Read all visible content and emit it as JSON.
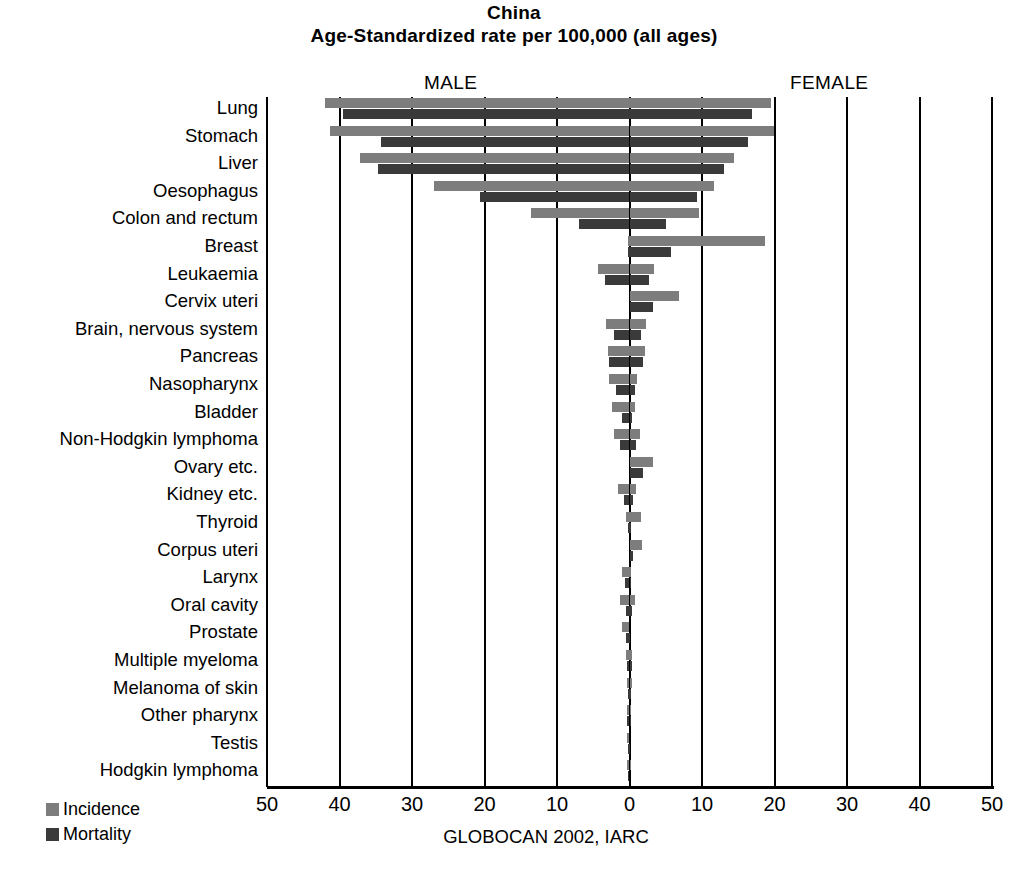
{
  "title": {
    "line1": "China",
    "line2": "Age-Standardized rate per 100,000 (all ages)"
  },
  "male_label": "MALE",
  "female_label": "FEMALE",
  "source": "GLOBOCAN 2002, IARC",
  "legend": [
    {
      "name": "Incidence",
      "color": "#7d7d7d"
    },
    {
      "name": "Mortality",
      "color": "#3a3a3a"
    }
  ],
  "colors": {
    "incidence": "#7d7d7d",
    "mortality": "#3a3a3a",
    "axis": "#000000",
    "background": "#ffffff"
  },
  "chart_data": {
    "type": "bar",
    "orientation": "horizontal",
    "subtype": "population-pyramid / back-to-back bar",
    "xlabel": "",
    "ylabel": "",
    "xlim": [
      -50,
      50
    ],
    "xticks": [
      50,
      40,
      30,
      20,
      10,
      0,
      10,
      20,
      30,
      40,
      50
    ],
    "xtick_labels": [
      "50",
      "40",
      "30",
      "20",
      "10",
      "0",
      "10",
      "20",
      "30",
      "40",
      "50"
    ],
    "left_panel": "MALE",
    "right_panel": "FEMALE",
    "grid": true,
    "legend_position": "bottom-left",
    "units": "rate per 100,000",
    "source": "GLOBOCAN 2002, IARC",
    "categories": [
      "Lung",
      "Stomach",
      "Liver",
      "Oesophagus",
      "Colon and rectum",
      "Breast",
      "Leukaemia",
      "Cervix uteri",
      "Brain, nervous system",
      "Pancreas",
      "Nasopharynx",
      "Bladder",
      "Non-Hodgkin lymphoma",
      "Ovary etc.",
      "Kidney etc.",
      "Thyroid",
      "Corpus uteri",
      "Larynx",
      "Oral cavity",
      "Prostate",
      "Multiple myeloma",
      "Melanoma of skin",
      "Other pharynx",
      "Testis",
      "Hodgkin lymphoma"
    ],
    "series": [
      {
        "name": "Male incidence",
        "side": "left",
        "color": "#7d7d7d",
        "values": [
          42.0,
          41.3,
          37.2,
          27.0,
          13.6,
          0.2,
          4.3,
          0.0,
          3.3,
          3.0,
          2.8,
          2.4,
          2.2,
          0.0,
          1.6,
          0.5,
          0.0,
          1.0,
          1.3,
          1.1,
          0.5,
          0.3,
          0.4,
          0.3,
          0.3
        ]
      },
      {
        "name": "Male mortality",
        "side": "left",
        "color": "#3a3a3a",
        "values": [
          39.5,
          34.3,
          34.7,
          20.6,
          6.9,
          0.1,
          3.4,
          0.0,
          2.2,
          2.8,
          1.9,
          1.1,
          1.3,
          0.0,
          0.8,
          0.1,
          0.0,
          0.6,
          0.5,
          0.5,
          0.4,
          0.2,
          0.3,
          0.1,
          0.2
        ]
      },
      {
        "name": "Female incidence",
        "side": "right",
        "color": "#7d7d7d",
        "values": [
          19.5,
          19.9,
          14.4,
          11.6,
          9.6,
          18.7,
          3.4,
          6.8,
          2.3,
          2.1,
          1.1,
          0.7,
          1.5,
          3.2,
          0.9,
          1.6,
          1.7,
          0.2,
          0.8,
          0.0,
          0.4,
          0.3,
          0.1,
          0.0,
          0.2
        ]
      },
      {
        "name": "Female mortality",
        "side": "right",
        "color": "#3a3a3a",
        "values": [
          16.9,
          16.4,
          13.0,
          9.3,
          5.0,
          5.7,
          2.7,
          3.2,
          1.6,
          1.9,
          0.8,
          0.4,
          0.9,
          1.8,
          0.5,
          0.2,
          0.5,
          0.1,
          0.3,
          0.0,
          0.3,
          0.2,
          0.1,
          0.0,
          0.1
        ]
      }
    ]
  }
}
